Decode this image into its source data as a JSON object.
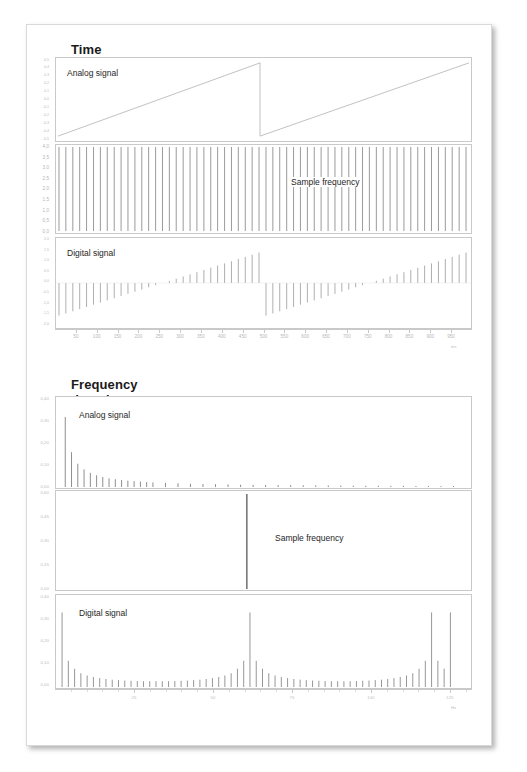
{
  "page": {
    "background": "#ffffff",
    "border_color": "#d9d9d9"
  },
  "sections": {
    "time": {
      "title": "Time domain",
      "xaxis_label": "ms",
      "xticks": [
        "50",
        "100",
        "150",
        "200",
        "250",
        "300",
        "350",
        "400",
        "450",
        "500",
        "550",
        "600",
        "650",
        "700",
        "750",
        "800",
        "850",
        "900",
        "950"
      ],
      "panels": [
        {
          "label": "Analog signal",
          "yticks": [
            "0,5",
            "0,4",
            "0,3",
            "0,2",
            "0,1",
            "0,0",
            "-0,1",
            "-0,2",
            "-0,3",
            "-0,4",
            "-0,5"
          ]
        },
        {
          "label": "Sample frequency",
          "yticks": [
            "4,0",
            "3,5",
            "3,0",
            "2,5",
            "2,0",
            "1,5",
            "1,0",
            "0,5",
            "0,0"
          ]
        },
        {
          "label": "Digital signal",
          "yticks": [
            "2,0",
            "1,5",
            "1,0",
            "0,5",
            "0,0",
            "-0,5",
            "-1,0",
            "-1,5",
            "-2,0"
          ]
        }
      ]
    },
    "frequency": {
      "title": "Frequency domain",
      "xaxis_label": "Hz",
      "xticks": [
        "25",
        "50",
        "75",
        "100",
        "125"
      ],
      "panels": [
        {
          "label": "Analog signal",
          "yticks": [
            "0,40",
            "0,30",
            "0,20",
            "0,10",
            "0,00"
          ]
        },
        {
          "label": "Sample frequency",
          "yticks": [
            "0,60",
            "0,45",
            "0,30",
            "0,15",
            "0,00"
          ]
        },
        {
          "label": "Digital signal",
          "yticks": [
            "0,40",
            "0,30",
            "0,20",
            "0,10",
            "0,00"
          ]
        }
      ]
    }
  },
  "chart_data": [
    {
      "type": "line",
      "title": "Time domain — Analog signal",
      "xlabel": "ms",
      "ylabel": "",
      "xlim": [
        0,
        1000
      ],
      "ylim": [
        -0.5,
        0.5
      ],
      "grid": false,
      "description": "Sawtooth ramp rising from -0.5 to +0.5 over 500 ms, resetting at 500 ms and ramping again to 1000 ms",
      "x": [
        0,
        500,
        500,
        1000
      ],
      "y": [
        -0.5,
        0.5,
        -0.5,
        0.5
      ]
    },
    {
      "type": "bar",
      "title": "Time domain — Sample frequency",
      "xlabel": "ms",
      "ylabel": "",
      "xlim": [
        0,
        1000
      ],
      "ylim": [
        0,
        4.0
      ],
      "grid": false,
      "description": "Uniform impulse train of 60 equal-height sampling pulses spanning the full time axis",
      "n_impulses": 60,
      "impulse_height": 4.0
    },
    {
      "type": "bar",
      "title": "Time domain — Digital signal",
      "xlabel": "ms",
      "ylabel": "",
      "xlim": [
        0,
        1000
      ],
      "ylim": [
        -2.0,
        2.0
      ],
      "grid": false,
      "description": "Sampled sawtooth: impulses ramp from -1.45 up through zero to +1.45 across each 500 ms period, then reset",
      "n_samples": 60,
      "period_ms": 500,
      "amplitude": 1.45
    },
    {
      "type": "bar",
      "title": "Frequency domain — Analog signal",
      "xlabel": "Hz",
      "ylabel": "",
      "xlim": [
        0,
        130
      ],
      "ylim": [
        0.0,
        0.4
      ],
      "grid": false,
      "description": "Harmonic spectrum of the sawtooth: fundamental at ~0.32 with 1/n decaying harmonics tapering to near zero",
      "x": [
        2,
        4,
        6,
        8,
        10,
        12,
        14,
        16,
        18,
        20,
        22,
        24,
        26,
        28,
        30,
        34,
        38,
        42,
        46,
        50,
        54,
        58,
        62,
        66,
        70,
        74,
        78,
        82,
        86,
        90,
        94,
        98,
        102,
        106,
        110,
        114,
        118,
        122,
        126
      ],
      "y": [
        0.322,
        0.16,
        0.107,
        0.081,
        0.065,
        0.054,
        0.046,
        0.04,
        0.036,
        0.032,
        0.029,
        0.027,
        0.025,
        0.023,
        0.021,
        0.019,
        0.017,
        0.015,
        0.014,
        0.013,
        0.012,
        0.011,
        0.01,
        0.0095,
        0.009,
        0.0085,
        0.008,
        0.0075,
        0.007,
        0.0067,
        0.0064,
        0.006,
        0.0058,
        0.0055,
        0.0052,
        0.005,
        0.0048,
        0.0046,
        0.0044
      ]
    },
    {
      "type": "bar",
      "title": "Frequency domain — Sample frequency",
      "xlabel": "Hz",
      "ylabel": "",
      "xlim": [
        0,
        130
      ],
      "ylim": [
        0.0,
        0.6
      ],
      "grid": false,
      "description": "Single spectral line at the sampling frequency (~60 Hz) reaching 0.60",
      "x": [
        60
      ],
      "y": [
        0.6
      ]
    },
    {
      "type": "bar",
      "title": "Frequency domain — Digital signal",
      "xlabel": "Hz",
      "ylabel": "",
      "xlim": [
        0,
        130
      ],
      "ylim": [
        0.0,
        0.4
      ],
      "grid": false,
      "description": "Spectrum of the sampled signal showing the baseband harmonics plus mirrored alias images around the 60 Hz sample frequency and at 125 Hz",
      "x": [
        1,
        3,
        5,
        7,
        9,
        11,
        13,
        15,
        17,
        19,
        21,
        23,
        25,
        27,
        29,
        31,
        33,
        35,
        37,
        39,
        41,
        43,
        45,
        47,
        49,
        51,
        53,
        55,
        57,
        59,
        61,
        63,
        65,
        67,
        69,
        71,
        73,
        75,
        77,
        79,
        81,
        83,
        85,
        87,
        89,
        91,
        93,
        95,
        97,
        99,
        101,
        103,
        105,
        107,
        109,
        111,
        113,
        115,
        117,
        119,
        121,
        123,
        125
      ],
      "y": [
        0.335,
        0.118,
        0.082,
        0.062,
        0.052,
        0.045,
        0.04,
        0.036,
        0.033,
        0.031,
        0.029,
        0.028,
        0.027,
        0.026,
        0.026,
        0.026,
        0.026,
        0.026,
        0.027,
        0.028,
        0.029,
        0.031,
        0.033,
        0.036,
        0.04,
        0.045,
        0.052,
        0.062,
        0.082,
        0.118,
        0.335,
        0.118,
        0.082,
        0.062,
        0.052,
        0.045,
        0.04,
        0.036,
        0.033,
        0.031,
        0.029,
        0.028,
        0.027,
        0.026,
        0.026,
        0.026,
        0.026,
        0.027,
        0.028,
        0.029,
        0.031,
        0.033,
        0.036,
        0.04,
        0.045,
        0.052,
        0.062,
        0.082,
        0.118,
        0.335,
        0.118,
        0.082,
        0.335
      ]
    }
  ]
}
